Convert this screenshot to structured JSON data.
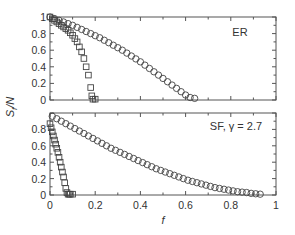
{
  "chart_data": [
    {
      "type": "scatter",
      "panel": "top",
      "annotation": "ER",
      "xlabel": "f",
      "ylabel": "S_f/N",
      "xlim": [
        0,
        1
      ],
      "ylim": [
        0,
        1
      ],
      "yticks": [
        "0",
        "0.2",
        "0.4",
        "0.6",
        "0.8",
        "1"
      ],
      "grid": false,
      "series": [
        {
          "name": "circles",
          "marker": "circle",
          "x": [
            0,
            0.02,
            0.04,
            0.06,
            0.08,
            0.1,
            0.12,
            0.14,
            0.16,
            0.18,
            0.2,
            0.22,
            0.24,
            0.26,
            0.28,
            0.3,
            0.32,
            0.34,
            0.36,
            0.38,
            0.4,
            0.42,
            0.44,
            0.46,
            0.48,
            0.5,
            0.52,
            0.54,
            0.56,
            0.58,
            0.6,
            0.62,
            0.64
          ],
          "y": [
            1.0,
            0.98,
            0.96,
            0.94,
            0.92,
            0.9,
            0.875,
            0.85,
            0.825,
            0.8,
            0.775,
            0.75,
            0.72,
            0.69,
            0.66,
            0.63,
            0.6,
            0.565,
            0.53,
            0.495,
            0.46,
            0.42,
            0.38,
            0.34,
            0.3,
            0.26,
            0.22,
            0.18,
            0.14,
            0.1,
            0.06,
            0.03,
            0.02
          ]
        },
        {
          "name": "squares",
          "marker": "square",
          "x": [
            0,
            0.01,
            0.02,
            0.03,
            0.04,
            0.05,
            0.06,
            0.07,
            0.08,
            0.09,
            0.1,
            0.11,
            0.12,
            0.13,
            0.14,
            0.15,
            0.16,
            0.17,
            0.18,
            0.185,
            0.19,
            0.2
          ],
          "y": [
            1.0,
            0.98,
            0.96,
            0.94,
            0.92,
            0.9,
            0.88,
            0.86,
            0.84,
            0.81,
            0.78,
            0.74,
            0.7,
            0.64,
            0.58,
            0.5,
            0.4,
            0.3,
            0.15,
            0.05,
            0.01,
            0.01
          ]
        }
      ]
    },
    {
      "type": "scatter",
      "panel": "bottom",
      "annotation": "SF, γ = 2.7",
      "xlabel": "f",
      "ylabel": "S_f/N",
      "xlim": [
        0,
        1
      ],
      "ylim": [
        0,
        1
      ],
      "xticks": [
        "0",
        "0.2",
        "0.4",
        "0.6",
        "0.8",
        "1"
      ],
      "yticks": [
        "0",
        "0.2",
        "0.4",
        "0.6",
        "0.8"
      ],
      "grid": false,
      "series": [
        {
          "name": "circles",
          "marker": "circle",
          "x": [
            0.01,
            0.03,
            0.05,
            0.07,
            0.09,
            0.11,
            0.13,
            0.15,
            0.17,
            0.19,
            0.21,
            0.23,
            0.25,
            0.27,
            0.29,
            0.31,
            0.33,
            0.35,
            0.37,
            0.39,
            0.41,
            0.43,
            0.45,
            0.47,
            0.49,
            0.51,
            0.53,
            0.55,
            0.57,
            0.59,
            0.61,
            0.63,
            0.65,
            0.67,
            0.69,
            0.71,
            0.73,
            0.75,
            0.77,
            0.79,
            0.81,
            0.83,
            0.85,
            0.87,
            0.89,
            0.91,
            0.93
          ],
          "y": [
            0.96,
            0.93,
            0.9,
            0.87,
            0.84,
            0.81,
            0.78,
            0.75,
            0.72,
            0.69,
            0.66,
            0.63,
            0.6,
            0.57,
            0.545,
            0.52,
            0.495,
            0.47,
            0.445,
            0.42,
            0.395,
            0.37,
            0.345,
            0.32,
            0.3,
            0.28,
            0.26,
            0.24,
            0.22,
            0.2,
            0.18,
            0.165,
            0.15,
            0.135,
            0.12,
            0.105,
            0.09,
            0.08,
            0.07,
            0.06,
            0.05,
            0.04,
            0.035,
            0.03,
            0.02,
            0.015,
            0.01
          ]
        },
        {
          "name": "squares",
          "marker": "square",
          "x": [
            0.0,
            0.005,
            0.01,
            0.015,
            0.02,
            0.025,
            0.03,
            0.035,
            0.04,
            0.045,
            0.05,
            0.055,
            0.06,
            0.065,
            0.07,
            0.075,
            0.08,
            0.085,
            0.09,
            0.1
          ],
          "y": [
            0.87,
            0.82,
            0.77,
            0.72,
            0.67,
            0.62,
            0.57,
            0.52,
            0.46,
            0.4,
            0.34,
            0.28,
            0.22,
            0.15,
            0.08,
            0.03,
            0.01,
            0.01,
            0.01,
            0.01
          ]
        }
      ]
    }
  ],
  "axes": {
    "xlabel": "f",
    "ylabel_main": "S",
    "ylabel_sub": "f",
    "ylabel_tail": "/N"
  },
  "panels": {
    "top": {
      "annotation": "ER",
      "yticks": [
        "0",
        "0.2",
        "0.4",
        "0.6",
        "0.8",
        "1"
      ]
    },
    "bottom": {
      "annotation": "SF, γ = 2.7",
      "yticks": [
        "0",
        "0.2",
        "0.4",
        "0.6",
        "0.8"
      ],
      "xticks": [
        "0",
        "0.2",
        "0.4",
        "0.6",
        "0.8",
        "1"
      ]
    }
  }
}
